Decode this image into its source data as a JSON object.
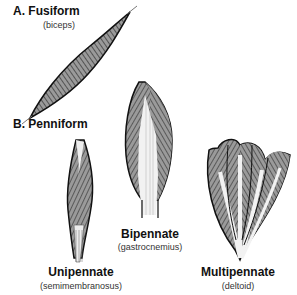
{
  "figure": {
    "section_a": {
      "label": "A. Fusiform",
      "example": "(biceps)"
    },
    "section_b": {
      "label": "B. Penniform"
    },
    "muscles": [
      {
        "type": "Unipennate",
        "example": "(semimembranosus)"
      },
      {
        "type": "Bipennate",
        "example": "(gastrocnemius)"
      },
      {
        "type": "Multipennate",
        "example": "(deltoid)"
      }
    ]
  },
  "colors": {
    "fiber": "#8a8a8a",
    "outline": "#111111",
    "tendon": "#e8e8e8",
    "background": "#ffffff"
  }
}
